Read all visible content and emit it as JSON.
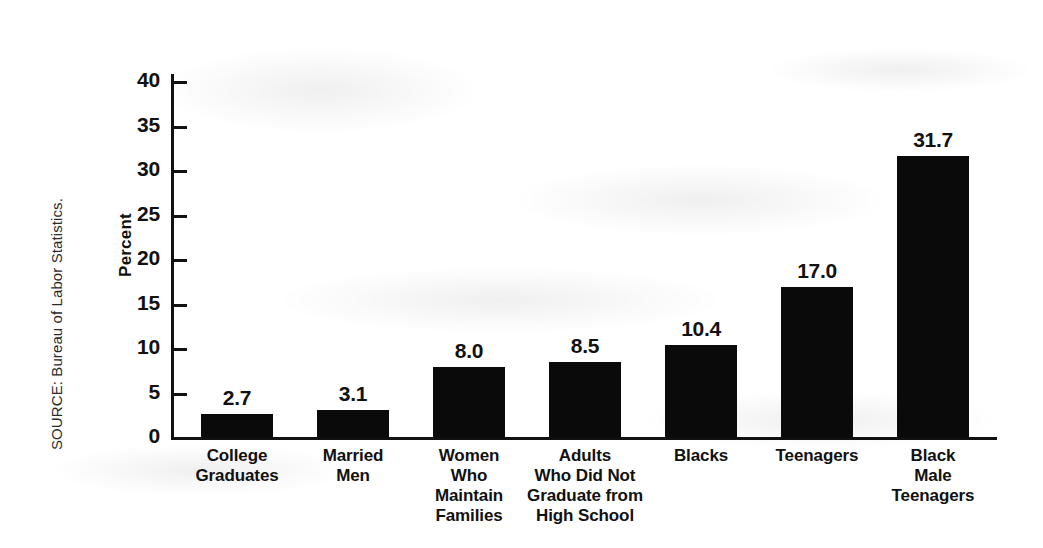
{
  "source_note": "SOURCE: Bureau of Labor Statistics.",
  "axis": {
    "y_title": "Percent",
    "y_ticks": [
      "0",
      "5",
      "10",
      "15",
      "20",
      "25",
      "30",
      "35",
      "40"
    ]
  },
  "colors": {
    "bar": "#0a0a0a",
    "axis": "#111111",
    "background": "#ffffff"
  },
  "chart_data": {
    "type": "bar",
    "title": "",
    "xlabel": "",
    "ylabel": "Percent",
    "ylim": [
      0,
      40
    ],
    "ytick_step": 5,
    "grid": false,
    "legend": "none",
    "orientation": "vertical",
    "categories": [
      "College Graduates",
      "Married Men",
      "Women Who Maintain Families",
      "Adults Who Did Not Graduate from High School",
      "Blacks",
      "Teenagers",
      "Black Male Teenagers"
    ],
    "category_lines": [
      [
        "College",
        "Graduates"
      ],
      [
        "Married",
        "Men"
      ],
      [
        "Women",
        "Who",
        "Maintain",
        "Families"
      ],
      [
        "Adults",
        "Who Did Not",
        "Graduate from",
        "High School"
      ],
      [
        "Blacks"
      ],
      [
        "Teenagers"
      ],
      [
        "Black",
        "Male",
        "Teenagers"
      ]
    ],
    "values": [
      2.7,
      3.1,
      8.0,
      8.5,
      10.4,
      17.0,
      31.7
    ],
    "value_labels": [
      "2.7",
      "3.1",
      "8.0",
      "8.5",
      "10.4",
      "17.0",
      "31.7"
    ]
  }
}
